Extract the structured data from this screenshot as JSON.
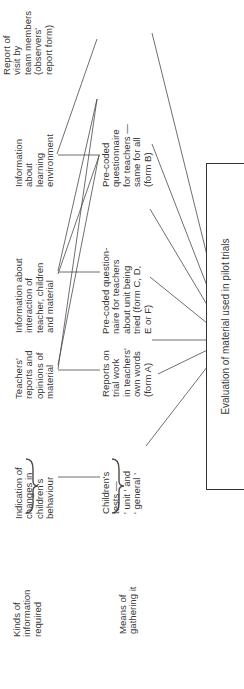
{
  "row_labels": {
    "kinds": "Kinds of\ninformation\nrequired",
    "means": "Means of\ngathering it"
  },
  "information_required": [
    "Indication of\nchanges in\nchildren's\nbehaviour",
    "Teachers'\nreports and\nopinions of\nmaterial",
    "Information about\ninteraction of\nteacher, children\nand material",
    "Information\nabout\nlearning\nenvironment"
  ],
  "means_of_gathering": [
    "Children's\ntests —\n' unit ' and\n' general '",
    "Reports on\ntrial work\nin teachers'\nown words\n(form A)",
    "Pre-coded question-\nnaire for teachers\nabout unit being\ntried (form C, D,\nE or F)",
    "Pre-coded\nquestionnaire\nfor teachers —\nsame for all\n(form B)",
    "Report of\nvisit by\nteam members\n(observers'\nreport form)"
  ],
  "target_box": {
    "label": "Evaluation of material used in pilot trials"
  },
  "colors": {
    "line": "#4a4a4a",
    "text": "#3a3a3a",
    "background": "#ffffff"
  }
}
